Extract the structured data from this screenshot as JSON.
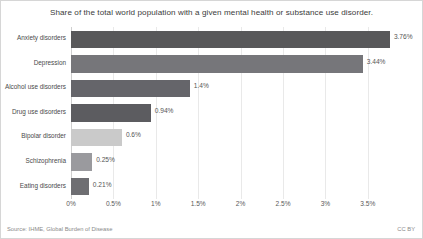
{
  "chart_data": {
    "type": "bar",
    "orientation": "horizontal",
    "title": "Share of the total world population with a given mental health or substance use disorder.",
    "xlabel": "",
    "ylabel": "",
    "xlim": [
      0,
      3.95
    ],
    "grid": true,
    "legend": null,
    "categories": [
      "Anxiety disorders",
      "Depression",
      "Alcohol use disorders",
      "Drug use disorders",
      "Bipolar disorder",
      "Schizophrenia",
      "Eating disorders"
    ],
    "values": [
      3.76,
      3.44,
      1.4,
      0.94,
      0.6,
      0.25,
      0.21
    ],
    "value_labels": [
      "3.76%",
      "3.44%",
      "1.4%",
      "0.94%",
      "0.6%",
      "0.25%",
      "0.21%"
    ],
    "bar_colors": [
      "#58585a",
      "#76767a",
      "#65656a",
      "#5c5c60",
      "#cacaca",
      "#9a9a9e",
      "#6e6e72"
    ],
    "xticks": [
      0,
      0.5,
      1,
      1.5,
      2,
      2.5,
      3,
      3.5
    ],
    "xticklabels": [
      "0%",
      "0.5%",
      "1%",
      "1.5%",
      "2%",
      "2.5%",
      "3%",
      "3.5%"
    ]
  },
  "footer": {
    "source": "Source: IHME, Global Burden of Disease",
    "license": "CC BY"
  }
}
